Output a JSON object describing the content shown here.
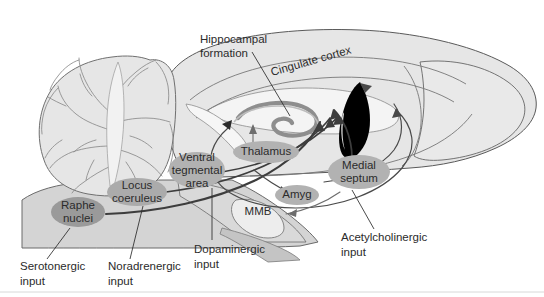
{
  "figure": {
    "background_color": "#ffffff",
    "brain_fill": "#e6e6e6",
    "brain_stroke": "#555555",
    "brainstem_fill": "#d2d2d2",
    "nucleus_fill": "#b2b2b2",
    "nucleus_fill_dark": "#9a9a9a",
    "hippocampus_fill": "#8e8e8e",
    "septum_fill": "#000000",
    "pathway_stroke": "#3d3d3d",
    "leader_stroke": "#2b2b2b",
    "text_color": "#2b2b2b"
  },
  "structures": [
    {
      "id": "hippocampal-formation",
      "label": "Hippocampal",
      "label2": "formation",
      "x": 200,
      "y": 38
    },
    {
      "id": "cingulate-cortex",
      "label": "Cingulate cortex",
      "x": 272,
      "y": 72,
      "rotation": -16
    },
    {
      "id": "thalamus",
      "label": "Thalamus",
      "x": 266,
      "y": 152
    },
    {
      "id": "ventral-tegmental-area",
      "label": "Ventral",
      "label2": "tegmental",
      "label3": "area",
      "x": 197,
      "y": 168
    },
    {
      "id": "locus-coeruleus",
      "label": "Locus",
      "label2": "coeruleus",
      "x": 137,
      "y": 192
    },
    {
      "id": "raphe-nuclei",
      "label": "Raphe",
      "label2": "nuclei",
      "x": 78,
      "y": 212
    },
    {
      "id": "medial-septum",
      "label": "Medial",
      "label2": "septum",
      "x": 359,
      "y": 172
    },
    {
      "id": "amygdala",
      "label": "Amyg",
      "x": 297,
      "y": 195
    },
    {
      "id": "mammillary-body",
      "label": "MMB",
      "x": 258,
      "y": 212
    }
  ],
  "inputs": [
    {
      "id": "serotonergic-input",
      "label": "Serotonergic",
      "label2": "input",
      "x": 20,
      "y": 267
    },
    {
      "id": "noradrenergic-input",
      "label": "Noradrenergic",
      "label2": "input",
      "x": 108,
      "y": 267
    },
    {
      "id": "dopaminergic-input",
      "label": "Dopaminergic",
      "label2": "input",
      "x": 194,
      "y": 250
    },
    {
      "id": "acetylcholinergic-input",
      "label": "Acetylcholinergic",
      "label2": "input",
      "x": 341,
      "y": 238
    }
  ]
}
